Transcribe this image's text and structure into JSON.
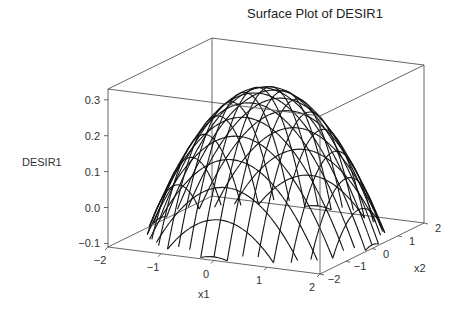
{
  "chart_data": {
    "type": "surface",
    "title": "Surface Plot of DESIR1",
    "xlabel": "x1",
    "ylabel": "x2",
    "zlabel": "DESIR1",
    "x_ticks": [
      "-2",
      "-1",
      "0",
      "1",
      "2"
    ],
    "y_ticks": [
      "-2",
      "-1",
      "0",
      "1",
      "2"
    ],
    "z_ticks": [
      "-0.1",
      "0.0",
      "0.1",
      "0.2",
      "0.3"
    ],
    "xlim": [
      -2,
      2
    ],
    "ylim": [
      -2,
      2
    ],
    "zlim": [
      -0.11,
      0.33
    ],
    "surface": {
      "shape": "concave-down paraboloid",
      "peak": {
        "x1": 0,
        "x2": 0,
        "z": 0.3
      },
      "approx_formula": "z = 0.30 - 0.1*(x1^2 + x2^2)",
      "grid_lines_per_axis": 17,
      "render": "wireframe"
    },
    "grid": false,
    "legend": null
  },
  "labels": {
    "title": "Surface Plot of DESIR1",
    "zlabel": "DESIR1",
    "xlabel": "x1",
    "ylabel": "x2"
  },
  "colors": {
    "wireframe": "#111111",
    "box": "#555555",
    "text": "#333333"
  }
}
